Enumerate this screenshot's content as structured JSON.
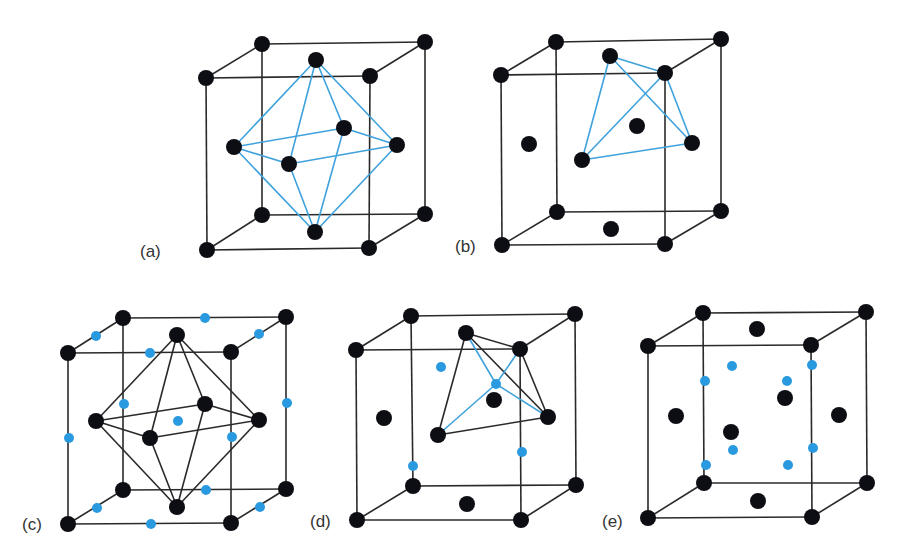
{
  "figure": {
    "colors": {
      "atom": "#0d0d14",
      "interstitial_site": "#2a9ae0",
      "edge": "#2a2a2a",
      "blue_bond": "#3fa2dc"
    },
    "atom_radius": 8,
    "site_radius": 5,
    "panels": [
      {
        "id": "a",
        "label": "(a)",
        "label_pos": [
          140,
          257
        ],
        "cube": {
          "fbl": [
            207,
            250
          ],
          "fbr": [
            369,
            248
          ],
          "ftl": [
            206,
            78
          ],
          "ftr": [
            370,
            76
          ],
          "bbl": [
            262,
            215
          ],
          "bbr": [
            425,
            214
          ],
          "btl": [
            262,
            44
          ],
          "btr": [
            425,
            42
          ]
        },
        "atoms": [
          [
            206,
            78
          ],
          [
            262,
            44
          ],
          [
            316,
            60
          ],
          [
            370,
            76
          ],
          [
            425,
            42
          ],
          [
            234,
            147
          ],
          [
            289,
            164
          ],
          [
            344,
            128
          ],
          [
            397,
            145
          ],
          [
            262,
            215
          ],
          [
            315,
            232
          ],
          [
            425,
            214
          ],
          [
            207,
            250
          ],
          [
            369,
            248
          ]
        ],
        "sites": [],
        "blue_bonds": [
          [
            [
              316,
              60
            ],
            [
              234,
              147
            ]
          ],
          [
            [
              316,
              60
            ],
            [
              289,
              164
            ]
          ],
          [
            [
              316,
              60
            ],
            [
              344,
              128
            ]
          ],
          [
            [
              316,
              60
            ],
            [
              397,
              145
            ]
          ],
          [
            [
              315,
              232
            ],
            [
              234,
              147
            ]
          ],
          [
            [
              315,
              232
            ],
            [
              289,
              164
            ]
          ],
          [
            [
              315,
              232
            ],
            [
              344,
              128
            ]
          ],
          [
            [
              315,
              232
            ],
            [
              397,
              145
            ]
          ],
          [
            [
              234,
              147
            ],
            [
              289,
              164
            ]
          ],
          [
            [
              289,
              164
            ],
            [
              397,
              145
            ]
          ],
          [
            [
              397,
              145
            ],
            [
              344,
              128
            ]
          ],
          [
            [
              344,
              128
            ],
            [
              234,
              147
            ]
          ]
        ],
        "black_bonds": []
      },
      {
        "id": "b",
        "label": "(b)",
        "label_pos": [
          455,
          252
        ],
        "cube": {
          "fbl": [
            502,
            245
          ],
          "fbr": [
            665,
            244
          ],
          "ftl": [
            501,
            75
          ],
          "ftr": [
            665,
            73
          ],
          "bbl": [
            557,
            212
          ],
          "bbr": [
            721,
            211
          ],
          "btl": [
            556,
            42
          ],
          "btr": [
            721,
            39
          ]
        },
        "atoms": [
          [
            501,
            75
          ],
          [
            556,
            42
          ],
          [
            610,
            56
          ],
          [
            665,
            73
          ],
          [
            721,
            39
          ],
          [
            529,
            144
          ],
          [
            637,
            126
          ],
          [
            692,
            143
          ],
          [
            582,
            160
          ],
          [
            557,
            212
          ],
          [
            611,
            229
          ],
          [
            721,
            211
          ],
          [
            502,
            245
          ],
          [
            665,
            244
          ]
        ],
        "sites": [],
        "blue_bonds": [
          [
            [
              610,
              56
            ],
            [
              665,
              73
            ]
          ],
          [
            [
              610,
              56
            ],
            [
              582,
              160
            ]
          ],
          [
            [
              610,
              56
            ],
            [
              692,
              143
            ]
          ],
          [
            [
              665,
              73
            ],
            [
              582,
              160
            ]
          ],
          [
            [
              665,
              73
            ],
            [
              692,
              143
            ]
          ],
          [
            [
              582,
              160
            ],
            [
              692,
              143
            ]
          ]
        ],
        "black_bonds": []
      },
      {
        "id": "c",
        "label": "(c)",
        "label_pos": [
          22,
          530
        ],
        "cube": {
          "fbl": [
            68,
            524
          ],
          "fbr": [
            231,
            523
          ],
          "ftl": [
            68,
            353
          ],
          "ftr": [
            231,
            352
          ],
          "bbl": [
            123,
            490
          ],
          "bbr": [
            286,
            489
          ],
          "btl": [
            123,
            318
          ],
          "btr": [
            286,
            317
          ]
        },
        "atoms": [
          [
            123,
            318
          ],
          [
            68,
            353
          ],
          [
            177,
            335
          ],
          [
            231,
            352
          ],
          [
            286,
            317
          ],
          [
            96,
            421
          ],
          [
            150,
            438
          ],
          [
            205,
            404
          ],
          [
            259,
            420
          ],
          [
            123,
            490
          ],
          [
            177,
            507
          ],
          [
            286,
            489
          ],
          [
            68,
            524
          ],
          [
            231,
            523
          ]
        ],
        "sites": [
          [
            96,
            336
          ],
          [
            205,
            318
          ],
          [
            150,
            353
          ],
          [
            259,
            334
          ],
          [
            124,
            404
          ],
          [
            287,
            403
          ],
          [
            178,
            421
          ],
          [
            69,
            438
          ],
          [
            232,
            437
          ],
          [
            97,
            508
          ],
          [
            206,
            490
          ],
          [
            151,
            524
          ],
          [
            260,
            507
          ]
        ],
        "blue_bonds": [],
        "black_bonds": [
          [
            [
              177,
              335
            ],
            [
              96,
              421
            ]
          ],
          [
            [
              177,
              335
            ],
            [
              150,
              438
            ]
          ],
          [
            [
              177,
              335
            ],
            [
              205,
              404
            ]
          ],
          [
            [
              177,
              335
            ],
            [
              259,
              420
            ]
          ],
          [
            [
              177,
              507
            ],
            [
              96,
              421
            ]
          ],
          [
            [
              177,
              507
            ],
            [
              150,
              438
            ]
          ],
          [
            [
              177,
              507
            ],
            [
              205,
              404
            ]
          ],
          [
            [
              177,
              507
            ],
            [
              259,
              420
            ]
          ],
          [
            [
              96,
              421
            ],
            [
              150,
              438
            ]
          ],
          [
            [
              150,
              438
            ],
            [
              259,
              420
            ]
          ],
          [
            [
              259,
              420
            ],
            [
              205,
              404
            ]
          ],
          [
            [
              205,
              404
            ],
            [
              96,
              421
            ]
          ]
        ]
      },
      {
        "id": "d",
        "label": "(d)",
        "label_pos": [
          310,
          527
        ],
        "cube": {
          "fbl": [
            357,
            520
          ],
          "fbr": [
            521,
            520
          ],
          "ftl": [
            356,
            350
          ],
          "ftr": [
            520,
            349
          ],
          "bbl": [
            413,
            486
          ],
          "bbr": [
            576,
            485
          ],
          "btl": [
            411,
            316
          ],
          "btr": [
            575,
            314
          ]
        },
        "atoms": [
          [
            411,
            316
          ],
          [
            356,
            350
          ],
          [
            466,
            333
          ],
          [
            520,
            349
          ],
          [
            575,
            314
          ],
          [
            384,
            418
          ],
          [
            494,
            400
          ],
          [
            548,
            417
          ],
          [
            438,
            435
          ],
          [
            413,
            486
          ],
          [
            467,
            504
          ],
          [
            576,
            485
          ],
          [
            357,
            520
          ],
          [
            521,
            520
          ]
        ],
        "sites": [
          [
            496,
            384
          ],
          [
            441,
            367
          ],
          [
            413,
            466
          ],
          [
            522,
            452
          ]
        ],
        "blue_bonds": [
          [
            [
              496,
              384
            ],
            [
              466,
              333
            ]
          ],
          [
            [
              496,
              384
            ],
            [
              520,
              349
            ]
          ],
          [
            [
              496,
              384
            ],
            [
              548,
              417
            ]
          ],
          [
            [
              496,
              384
            ],
            [
              438,
              435
            ]
          ]
        ],
        "black_bonds": [
          [
            [
              466,
              333
            ],
            [
              520,
              349
            ]
          ],
          [
            [
              466,
              333
            ],
            [
              438,
              435
            ]
          ],
          [
            [
              466,
              333
            ],
            [
              548,
              417
            ]
          ],
          [
            [
              520,
              349
            ],
            [
              548,
              417
            ]
          ],
          [
            [
              438,
              435
            ],
            [
              548,
              417
            ]
          ]
        ]
      },
      {
        "id": "e",
        "label": "(e)",
        "label_pos": [
          602,
          527
        ],
        "cube": {
          "fbl": [
            648,
            518
          ],
          "fbr": [
            812,
            517
          ],
          "ftl": [
            648,
            346
          ],
          "ftr": [
            811,
            345
          ],
          "bbl": [
            704,
            483
          ],
          "bbr": [
            867,
            483
          ],
          "btl": [
            703,
            313
          ],
          "btr": [
            866,
            312
          ]
        },
        "atoms": [
          [
            703,
            313
          ],
          [
            648,
            346
          ],
          [
            757,
            329
          ],
          [
            811,
            345
          ],
          [
            866,
            312
          ],
          [
            676,
            416
          ],
          [
            785,
            398
          ],
          [
            731,
            432
          ],
          [
            839,
            415
          ],
          [
            704,
            483
          ],
          [
            758,
            501
          ],
          [
            867,
            483
          ],
          [
            648,
            518
          ],
          [
            812,
            517
          ]
        ],
        "sites": [
          [
            732,
            366
          ],
          [
            705,
            381
          ],
          [
            787,
            381
          ],
          [
            812,
            365
          ],
          [
            733,
            450
          ],
          [
            706,
            465
          ],
          [
            788,
            465
          ],
          [
            813,
            448
          ]
        ],
        "blue_bonds": [],
        "black_bonds": []
      }
    ]
  }
}
